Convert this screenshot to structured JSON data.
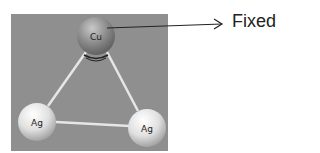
{
  "diagram": {
    "annotation": "Fixed",
    "panel_color": "#8f8f8f",
    "bond_color": "#e8e8e8",
    "atoms": [
      {
        "symbol": "Cu",
        "x": 96,
        "y": 36,
        "r": 19,
        "color": "#8a8a8a"
      },
      {
        "symbol": "Ag",
        "x": 37,
        "y": 122,
        "r": 19,
        "color": "#dcdcdc"
      },
      {
        "symbol": "Ag",
        "x": 147,
        "y": 128,
        "r": 19,
        "color": "#dcdcdc"
      }
    ],
    "bonds": [
      [
        "Cu",
        "Ag1"
      ],
      [
        "Cu",
        "Ag2"
      ],
      [
        "Ag1",
        "Ag2"
      ]
    ]
  }
}
